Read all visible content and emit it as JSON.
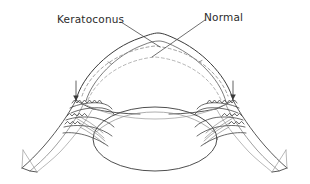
{
  "figure": {
    "type": "anatomical-cross-section",
    "background_color": "#ffffff",
    "line_color": "#3a3a3a",
    "faint_line_color": "#9a9a9a",
    "width": 310,
    "height": 184
  },
  "labels": {
    "keratoconus": "Keratoconus",
    "normal": "Normal"
  },
  "annotations": {
    "keratoconus_leader": {
      "label": "Keratoconus",
      "description": "leader line from text down-right to the pointed corneal apex",
      "from": [
        121,
        22
      ],
      "to": [
        160,
        47
      ]
    },
    "normal_leader": {
      "label": "Normal",
      "description": "leader line from text down-left to the dashed normal corneal contour",
      "from": [
        205,
        20
      ],
      "to": [
        152,
        57
      ]
    },
    "limbus_arrow_left": {
      "name": "limbus-arrow-left",
      "description": "vertical arrow pointing down to the left limbus",
      "from": [
        76,
        81
      ],
      "to": [
        76,
        103
      ]
    },
    "limbus_arrow_right": {
      "name": "limbus-arrow-right",
      "description": "vertical arrow pointing down to the right limbus",
      "from": [
        233,
        81
      ],
      "to": [
        233,
        102
      ]
    }
  },
  "structures": [
    {
      "name": "keratoconus-cornea",
      "style": "solid",
      "note": "conical steepened corneal profile peaking near x=158"
    },
    {
      "name": "normal-cornea-outer",
      "style": "dashed",
      "note": "flatter rounded corneal contour"
    },
    {
      "name": "normal-cornea-inner",
      "style": "dashed",
      "note": "inner dashed corneal contour"
    },
    {
      "name": "sclera-upper",
      "style": "solid",
      "note": "outer scleral wall sweeping to cut edges"
    },
    {
      "name": "sclera-lower",
      "style": "solid",
      "note": "lower scleral wall"
    },
    {
      "name": "crystalline-lens",
      "style": "solid",
      "note": "large central ellipse"
    },
    {
      "name": "iris-left",
      "style": "solid"
    },
    {
      "name": "iris-right",
      "style": "solid"
    },
    {
      "name": "ciliary-body-left",
      "style": "scalloped"
    },
    {
      "name": "ciliary-body-right",
      "style": "scalloped"
    },
    {
      "name": "zonular-fibers-left",
      "style": "fine-lines"
    },
    {
      "name": "zonular-fibers-right",
      "style": "fine-lines"
    },
    {
      "name": "sclera-cut-edge-left",
      "style": "solid"
    },
    {
      "name": "sclera-cut-edge-right",
      "style": "solid"
    }
  ]
}
